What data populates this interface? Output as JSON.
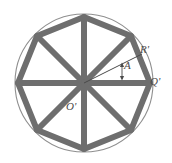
{
  "figure": {
    "type": "geometry-diagram",
    "background_color": "#ffffff",
    "colors": {
      "polygon_stroke": "#6e6e6e",
      "spoke_stroke": "#6e6e6e",
      "circle_stroke": "#8f8f8f",
      "thin_line_stroke": "#4a4a4a",
      "label_color": "#4a4a4a"
    },
    "circle": {
      "center_x": 84,
      "center_y": 83,
      "radius": 69,
      "stroke_width": 1
    },
    "polygon": {
      "sides": 8,
      "circumradius": 66,
      "stroke_width": 6,
      "start_angle_deg": 0,
      "vertices": [
        {
          "x": 150,
          "y": 83
        },
        {
          "x": 131,
          "y": 36
        },
        {
          "x": 84,
          "y": 17
        },
        {
          "x": 37,
          "y": 36
        },
        {
          "x": 18,
          "y": 83
        },
        {
          "x": 37,
          "y": 130
        },
        {
          "x": 84,
          "y": 149
        },
        {
          "x": 131,
          "y": 130
        }
      ]
    },
    "spokes": {
      "count": 8,
      "stroke_width": 6
    },
    "radius_line": {
      "name": "R-prime",
      "from_x": 84,
      "from_y": 83,
      "to_x": 141,
      "to_y": 55,
      "stroke_width": 1
    },
    "angle_marker": {
      "name": "A",
      "arc_radius": 44,
      "from_deg": 0,
      "to_deg": 26
    },
    "labels": {
      "radius": "R'",
      "vertex_right": "Q'",
      "angle": "A",
      "center": "O'"
    }
  }
}
